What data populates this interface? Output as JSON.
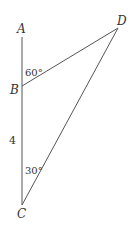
{
  "diagram": {
    "type": "geometry-triangle",
    "points": {
      "A": {
        "label": "A"
      },
      "B": {
        "label": "B"
      },
      "C": {
        "label": "C"
      },
      "D": {
        "label": "D"
      }
    },
    "segments": [
      "AC",
      "BD",
      "CD"
    ],
    "annotations": {
      "angle_ABD": "60°",
      "angle_BCD": "30°",
      "side_BC": "4"
    },
    "colors": {
      "line": "#555555",
      "text": "#333333",
      "background": "#ffffff"
    }
  }
}
